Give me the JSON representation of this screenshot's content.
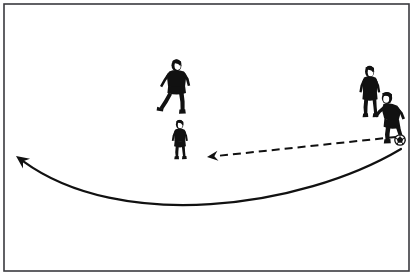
{
  "figure": {
    "description": "Line drawing of four soccer players on a white field with a framed border. A player on the right has the ball at his feet. A dashed arrow points left from the ball toward a player in the middle, and a long curved solid arrow sweeps from the right side down and around to the far left edge.",
    "background_color": "#ffffff",
    "ink_color": "#111111"
  },
  "frame": {
    "name": "diagram-border",
    "x": 4,
    "y": 4,
    "width": 405,
    "height": 267,
    "stroke_color": "#3a3a3f",
    "stroke_width": 1.6,
    "fill": "#ffffff"
  },
  "players": [
    {
      "id": "player-center-upper",
      "label": "Center upper player",
      "role": "defender",
      "x": 176,
      "y": 87,
      "scale": 1.0,
      "hair": "light",
      "jersey": "dark",
      "shorts": "dark",
      "has_ball": false
    },
    {
      "id": "player-center-lower",
      "label": "Center lower player",
      "role": "receiver",
      "x": 180,
      "y": 140,
      "scale": 0.82,
      "hair": "light",
      "jersey": "dark",
      "shorts": "dark",
      "has_ball": false
    },
    {
      "id": "player-right-standing",
      "label": "Right standing player",
      "role": "support",
      "x": 370,
      "y": 92,
      "scale": 0.95,
      "hair": "light",
      "jersey": "dark",
      "shorts": "dark",
      "has_ball": false
    },
    {
      "id": "player-right-with-ball",
      "label": "Right player with ball",
      "role": "passer",
      "x": 395,
      "y": 118,
      "scale": 1.0,
      "hair": "dark",
      "jersey": "dark",
      "shorts": "dark",
      "has_ball": true
    }
  ],
  "ball": {
    "id": "soccer-ball",
    "label": "Soccer ball",
    "cx": 400,
    "cy": 140,
    "r": 5.2,
    "stroke_color": "#111111",
    "fill": "#ffffff"
  },
  "arrows": [
    {
      "id": "pass-arrow",
      "label": "Pass direction (dashed)",
      "style": "dashed",
      "dash_pattern": "8 5",
      "stroke_width": 2.0,
      "stroke_color": "#111111",
      "from_x": 396,
      "from_y": 137,
      "to_x": 207,
      "to_y": 157,
      "head_at": "to",
      "head_size": 11
    },
    {
      "id": "run-arrow",
      "label": "Player run path (curved solid)",
      "style": "solid",
      "stroke_width": 2.2,
      "stroke_color": "#111111",
      "from_x": 401,
      "from_y": 149,
      "control1_x": 300,
      "control1_y": 209,
      "control2_x": 120,
      "control2_y": 232,
      "to_x": 16,
      "to_y": 156,
      "head_at": "to",
      "head_size": 13
    }
  ]
}
